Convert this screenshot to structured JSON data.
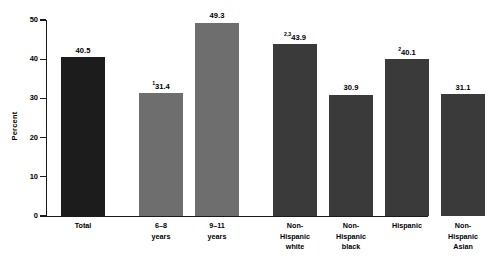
{
  "chart_data": {
    "type": "bar",
    "title": "",
    "xlabel": "",
    "ylabel": "Percent",
    "ylim": [
      0,
      50
    ],
    "yticks": [
      0,
      10,
      20,
      30,
      40,
      50
    ],
    "ytick_labels": [
      "0",
      "10",
      "20",
      "30",
      "40",
      "50"
    ],
    "grid": false,
    "legend": "none",
    "categories": [
      "Total",
      "6–8\nyears",
      "9–11\nyears",
      "Non-\nHispanic\nwhite",
      "Non-\nHispanic\nblack",
      "Hispanic",
      "Non-\nHispanic\nAsian"
    ],
    "values": [
      40.5,
      31.4,
      49.3,
      43.9,
      30.9,
      40.1,
      31.1
    ],
    "value_labels": [
      "40.5",
      "31.4",
      "49.3",
      "43.9",
      "30.9",
      "40.1",
      "31.1"
    ],
    "footnote_markers": [
      "",
      "1",
      "",
      "2,3",
      "",
      "2",
      ""
    ],
    "bar_colors": [
      "#1c1c1c",
      "#6e6e6e",
      "#6e6e6e",
      "#3a3a3a",
      "#3a3a3a",
      "#3a3a3a",
      "#3a3a3a"
    ],
    "groups": [
      {
        "name": "overall",
        "indices": [
          0
        ]
      },
      {
        "name": "age",
        "indices": [
          1,
          2
        ]
      },
      {
        "name": "race-ethnicity",
        "indices": [
          3,
          4,
          5,
          6
        ]
      }
    ],
    "axis_color": "#1a1a1a",
    "background": "#ffffff"
  }
}
